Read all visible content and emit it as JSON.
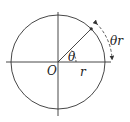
{
  "diagram": {
    "type": "unit-circle-arc-length",
    "labels": {
      "origin": "O",
      "angle": "θ",
      "radius": "r",
      "arc_length": "θr"
    },
    "geometry": {
      "center": [
        58,
        62
      ],
      "radius": 47,
      "angle_deg": 45
    },
    "colors": {
      "stroke": "#333333",
      "text": "#222222"
    }
  }
}
